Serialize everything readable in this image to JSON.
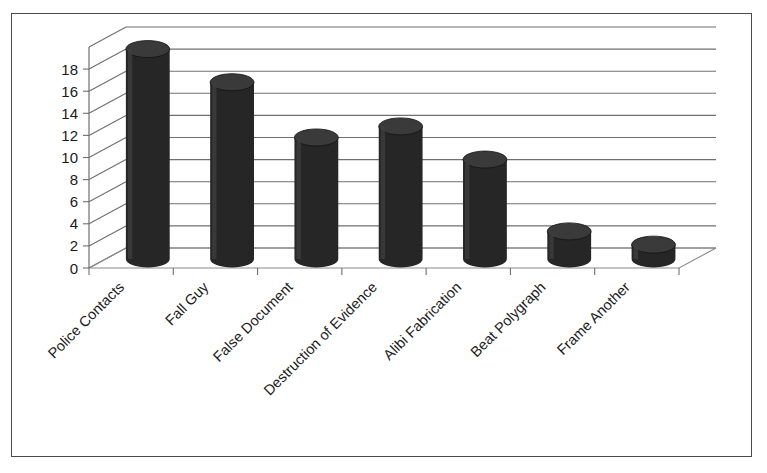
{
  "figure": {
    "clipped_caption": "",
    "border_color": "#4a4a4a",
    "background": "#ffffff"
  },
  "chart_data": {
    "type": "bar",
    "title": "",
    "subtitle": "",
    "xlabel": "",
    "ylabel": "",
    "ylim": [
      0,
      20
    ],
    "ytick_step": 2,
    "ytick_labels": [
      "0",
      "2",
      "4",
      "6",
      "8",
      "10",
      "12",
      "14",
      "16",
      "18"
    ],
    "ytick_values": [
      0,
      2,
      4,
      6,
      8,
      10,
      12,
      14,
      16,
      18
    ],
    "grid": true,
    "grid_axis": "y",
    "legend": false,
    "legend_position": "none",
    "style": "3d-cylinder",
    "bar_color": "#262626",
    "bar_top_color": "#3a3a3a",
    "categories": [
      "Police Contacts",
      "Fall Guy",
      "False Document",
      "Destruction of Evidence",
      "Alibi Fabrication",
      "Beat Polygraph",
      "Frame Another"
    ],
    "values": [
      19,
      16,
      11,
      12,
      9,
      2.5,
      1.3
    ],
    "category_label_rotation": -45,
    "annotations": []
  }
}
